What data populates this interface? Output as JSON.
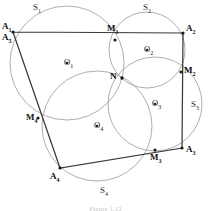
{
  "figure": {
    "caption": "Figure 1.12",
    "background_color": "#ffffff",
    "circle_stroke_color": "#9a9a9a",
    "polygon_stroke_color": "#3a3a3a",
    "label_color": "#111111"
  },
  "vertices": [
    {
      "name": "A1",
      "label": "A",
      "sub": "1",
      "x": 13,
      "y": 32,
      "label_x": 2,
      "label_y": 22
    },
    {
      "name": "A5",
      "label": "A",
      "sub": "5",
      "x": 13,
      "y": 32,
      "label_x": 2,
      "label_y": 33
    },
    {
      "name": "A2",
      "label": "A",
      "sub": "2",
      "x": 183,
      "y": 33,
      "label_x": 186,
      "label_y": 24
    },
    {
      "name": "A3",
      "label": "A",
      "sub": "3",
      "x": 182,
      "y": 148,
      "label_x": 186,
      "label_y": 145
    },
    {
      "name": "A4",
      "label": "A",
      "sub": "4",
      "x": 60,
      "y": 168,
      "label_x": 50,
      "label_y": 172
    }
  ],
  "side_points": [
    {
      "name": "M1",
      "label": "M",
      "sub": "1",
      "x": 115,
      "y": 40,
      "label_x": 107,
      "label_y": 24
    },
    {
      "name": "M2",
      "label": "M",
      "sub": "2",
      "x": 181,
      "y": 72,
      "label_x": 184,
      "label_y": 66
    },
    {
      "name": "M3",
      "label": "M",
      "sub": "3",
      "x": 155,
      "y": 150,
      "label_x": 150,
      "label_y": 153
    },
    {
      "name": "M4",
      "label": "M",
      "sub": "4",
      "x": 38,
      "y": 118,
      "label_x": 26,
      "label_y": 113
    }
  ],
  "intersection_point": {
    "name": "N",
    "label": "N",
    "x": 122,
    "y": 78,
    "label_x": 110,
    "label_y": 72
  },
  "centers": [
    {
      "name": "O1",
      "label": "O",
      "sub": "1",
      "x": 67,
      "y": 63,
      "label_x": 64,
      "label_y": 58
    },
    {
      "name": "O2",
      "label": "O",
      "sub": "2",
      "x": 147,
      "y": 50,
      "label_x": 144,
      "label_y": 45
    },
    {
      "name": "O3",
      "label": "O",
      "sub": "3",
      "x": 155,
      "y": 104,
      "label_x": 152,
      "label_y": 99
    },
    {
      "name": "O4",
      "label": "O",
      "sub": "4",
      "x": 97,
      "y": 126,
      "label_x": 94,
      "label_y": 121
    }
  ],
  "circles": [
    {
      "name": "S1",
      "label": "S",
      "sub": "1",
      "cx": 67,
      "cy": 63,
      "r": 57,
      "label_x": 33,
      "label_y": 3
    },
    {
      "name": "S2",
      "label": "S",
      "sub": "2",
      "cx": 147,
      "cy": 50,
      "r": 38,
      "label_x": 143,
      "label_y": 3
    },
    {
      "name": "S3",
      "label": "S",
      "sub": "3",
      "cx": 155,
      "cy": 104,
      "r": 47,
      "label_x": 191,
      "label_y": 100
    },
    {
      "name": "S4",
      "label": "S",
      "sub": "4",
      "cx": 97,
      "cy": 126,
      "r": 55,
      "label_x": 100,
      "label_y": 186
    }
  ],
  "polygon": {
    "name": "quadrilateral-A1A2A3A4",
    "points": "13,32 183,33 182,148 60,168 13,32"
  }
}
